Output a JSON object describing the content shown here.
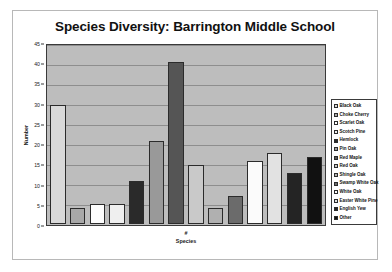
{
  "chart_data": {
    "type": "bar",
    "title": "Species Diversity: Barrington Middle School",
    "xlabel_line1": "#",
    "xlabel_line2": "Species",
    "ylabel": "Number",
    "ylim": [
      0,
      45
    ],
    "ytick_step": 5,
    "yticks": [
      "0",
      "5",
      "10",
      "15",
      "20",
      "25",
      "30",
      "35",
      "40",
      "45"
    ],
    "grid": true,
    "legend_position": "right",
    "categories": [
      "Black Oak",
      "Choke Cherry",
      "Scarlet Oak",
      "Scotch Pine",
      "Hemlock",
      "Pin Oak",
      "Red Maple",
      "Red Oak",
      "Shingle Oak",
      "Swamp White Oak",
      "White Oak",
      "Easter White Pine",
      "English Yew",
      "Other"
    ],
    "values": [
      30,
      4,
      5,
      5,
      11,
      21,
      41,
      15,
      4,
      7,
      16,
      18,
      13,
      17
    ],
    "colors": [
      "#d9d9d9",
      "#a8a8a8",
      "#fdfdfd",
      "#efefef",
      "#2a2a2a",
      "#999999",
      "#555555",
      "#c9c9c9",
      "#b0b0b0",
      "#6b6b6b",
      "#fbfbfb",
      "#e2e2e2",
      "#242424",
      "#111111"
    ],
    "plot_background": "#bdbdbd"
  }
}
